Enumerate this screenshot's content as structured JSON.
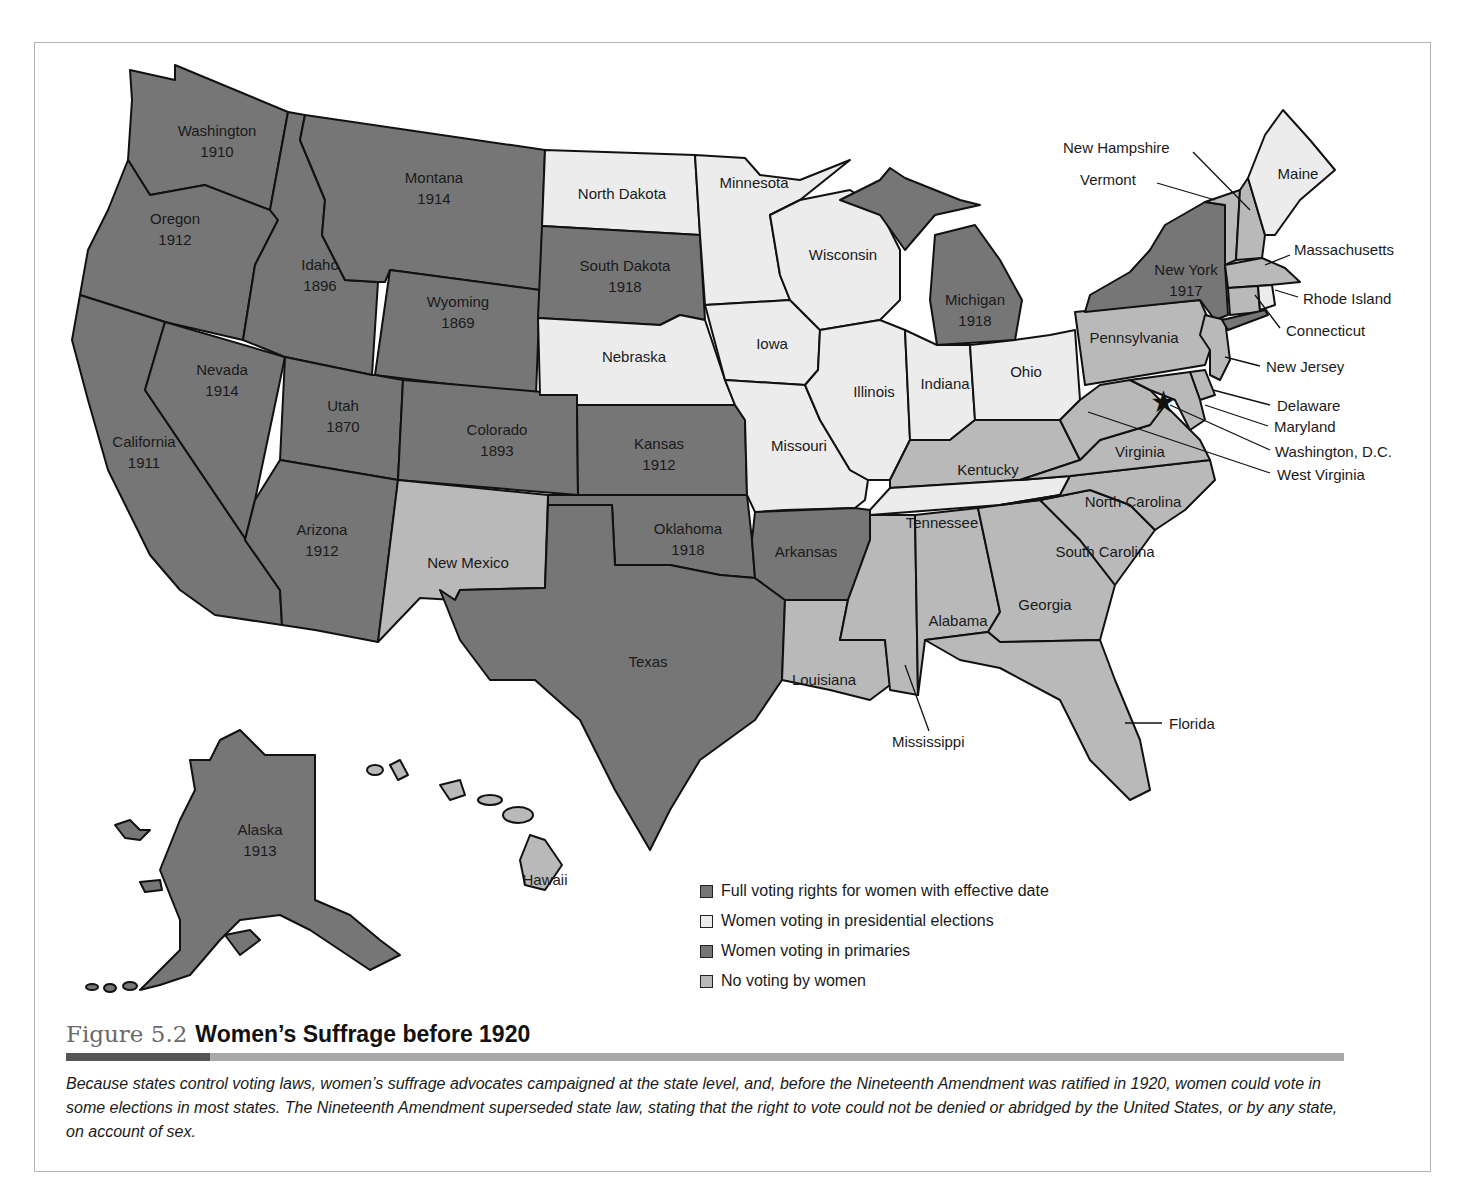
{
  "figure": {
    "number": "Figure 5.2",
    "title": "Women’s Suffrage before 1920",
    "caption": "Because states control voting laws, women’s suffrage advocates campaigned at the state level, and, before the Nineteenth Amendment was ratified in 1920, women could vote in some elections in most states. The Nineteenth Amendment superseded state law, stating that the right to vote could not be denied or abridged by the United States, or by any state, on account of sex."
  },
  "legend": {
    "items": [
      {
        "key": "full",
        "label": "Full voting rights for women with effective date",
        "color": "#767676"
      },
      {
        "key": "pres",
        "label": "Women voting in presidential elections",
        "color": "#ececec"
      },
      {
        "key": "prim",
        "label": "Women voting in primaries",
        "color": "#767676"
      },
      {
        "key": "none",
        "label": "No voting by women",
        "color": "#b9b9b9"
      }
    ]
  },
  "states": {
    "washington": {
      "name": "Washington",
      "year": "1910",
      "status": "full"
    },
    "oregon": {
      "name": "Oregon",
      "year": "1912",
      "status": "full"
    },
    "california": {
      "name": "California",
      "year": "1911",
      "status": "full"
    },
    "idaho": {
      "name": "Idaho",
      "year": "1896",
      "status": "full"
    },
    "nevada": {
      "name": "Nevada",
      "year": "1914",
      "status": "full"
    },
    "montana": {
      "name": "Montana",
      "year": "1914",
      "status": "full"
    },
    "wyoming": {
      "name": "Wyoming",
      "year": "1869",
      "status": "full"
    },
    "utah": {
      "name": "Utah",
      "year": "1870",
      "status": "full"
    },
    "colorado": {
      "name": "Colorado",
      "year": "1893",
      "status": "full"
    },
    "arizona": {
      "name": "Arizona",
      "year": "1912",
      "status": "full"
    },
    "new_mexico": {
      "name": "New Mexico",
      "status": "none"
    },
    "north_dakota": {
      "name": "North Dakota",
      "status": "pres"
    },
    "south_dakota": {
      "name": "South Dakota",
      "year": "1918",
      "status": "full"
    },
    "nebraska": {
      "name": "Nebraska",
      "status": "pres"
    },
    "kansas": {
      "name": "Kansas",
      "year": "1912",
      "status": "full"
    },
    "oklahoma": {
      "name": "Oklahoma",
      "year": "1918",
      "status": "full"
    },
    "texas": {
      "name": "Texas",
      "status": "prim"
    },
    "minnesota": {
      "name": "Minnesota",
      "status": "pres"
    },
    "iowa": {
      "name": "Iowa",
      "status": "pres"
    },
    "missouri": {
      "name": "Missouri",
      "status": "pres"
    },
    "arkansas": {
      "name": "Arkansas",
      "status": "prim"
    },
    "louisiana": {
      "name": "Louisiana",
      "status": "none"
    },
    "wisconsin": {
      "name": "Wisconsin",
      "status": "pres"
    },
    "illinois": {
      "name": "Illinois",
      "status": "pres"
    },
    "michigan": {
      "name": "Michigan",
      "year": "1918",
      "status": "full"
    },
    "indiana": {
      "name": "Indiana",
      "status": "pres"
    },
    "ohio": {
      "name": "Ohio",
      "status": "pres"
    },
    "kentucky": {
      "name": "Kentucky",
      "status": "none"
    },
    "tennessee": {
      "name": "Tennessee",
      "status": "pres"
    },
    "mississippi": {
      "name": "Mississippi",
      "status": "none"
    },
    "alabama": {
      "name": "Alabama",
      "status": "none"
    },
    "georgia": {
      "name": "Georgia",
      "status": "none"
    },
    "florida": {
      "name": "Florida",
      "status": "none"
    },
    "south_carolina": {
      "name": "South Carolina",
      "status": "none"
    },
    "north_carolina": {
      "name": "North Carolina",
      "status": "none"
    },
    "virginia": {
      "name": "Virginia",
      "status": "none"
    },
    "west_virginia": {
      "name": "West Virginia",
      "status": "none"
    },
    "pennsylvania": {
      "name": "Pennsylvania",
      "status": "none"
    },
    "new_york": {
      "name": "New York",
      "year": "1917",
      "status": "full"
    },
    "new_jersey": {
      "name": "New Jersey",
      "status": "none"
    },
    "delaware": {
      "name": "Delaware",
      "status": "none"
    },
    "maryland": {
      "name": "Maryland",
      "status": "none"
    },
    "washington_dc": {
      "name": "Washington, D.C.",
      "status": "none"
    },
    "connecticut": {
      "name": "Connecticut",
      "status": "none"
    },
    "rhode_island": {
      "name": "Rhode Island",
      "status": "pres"
    },
    "massachusetts": {
      "name": "Massachusetts",
      "status": "none"
    },
    "vermont": {
      "name": "Vermont",
      "status": "none"
    },
    "new_hampshire": {
      "name": "New Hampshire",
      "status": "none"
    },
    "maine": {
      "name": "Maine",
      "status": "pres"
    },
    "alaska": {
      "name": "Alaska",
      "year": "1913",
      "status": "full"
    },
    "hawaii": {
      "name": "Hawaii",
      "status": "none"
    }
  }
}
